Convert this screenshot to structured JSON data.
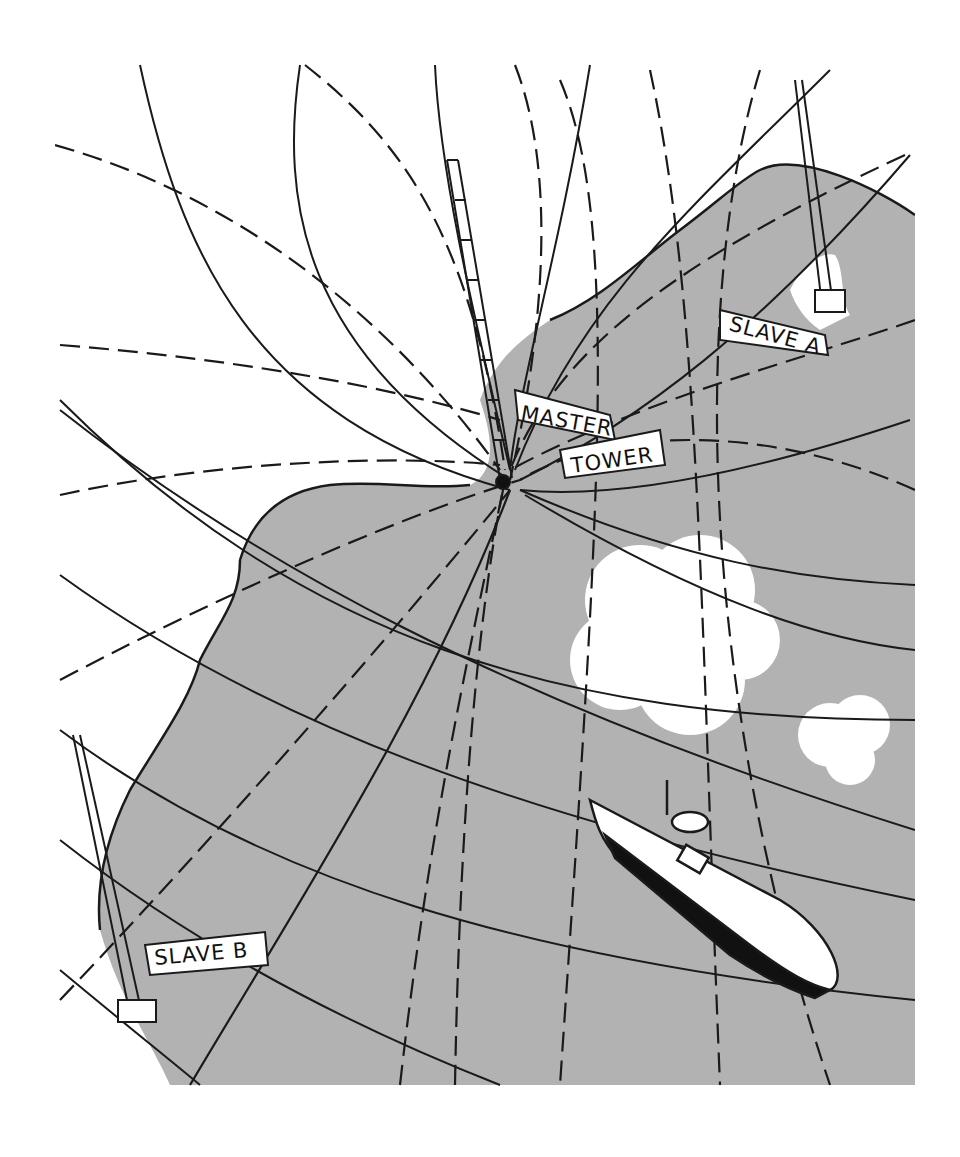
{
  "illustration": {
    "subject": "hyperbolic radio navigation grid",
    "colors": {
      "sea": "#b2b2b2",
      "land": "#ffffff",
      "ink": "#1a1a1a",
      "cloud": "#ffffff"
    }
  },
  "labels": {
    "master_line1": "MASTER",
    "master_line2": "TOWER",
    "slave_a": "SLAVE A",
    "slave_b": "SLAVE B"
  }
}
